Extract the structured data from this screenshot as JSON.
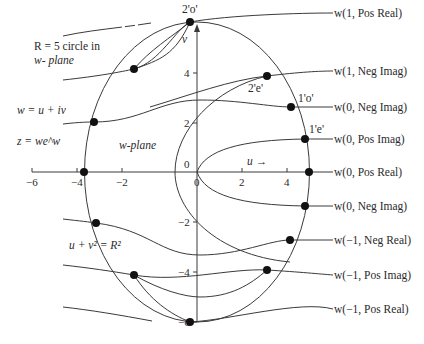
{
  "diagram": {
    "title_note": "R = 5 circle in",
    "title_note_2": "w- plane",
    "eq_w": "w = u + iv",
    "eq_z": "z = we^w",
    "plane_label": "w-plane",
    "u_arrow_label": "u →",
    "v_axis_label": "v",
    "circle_eq": "u + v² = R²",
    "x_ticks": [
      "−6",
      "−4",
      "−2",
      "0",
      "2",
      "4"
    ],
    "y_ticks": [
      "4",
      "2",
      "0",
      "−2",
      "−4",
      "−6"
    ],
    "point_labels": {
      "p2o": "2'o'",
      "p2e": "2'e'",
      "p1o": "1'o'",
      "p1e": "1'e'"
    },
    "branch_labels": [
      "w(1, Pos Real)",
      "w(1, Neg Imag)",
      "w(0, Neg Imag)",
      "w(0, Pos Imag)",
      "w(0, Pos Real)",
      "w(0, Neg Imag)",
      "w(−1, Neg Real)",
      "w(−1, Pos Imag)",
      "w(−1, Pos Real)"
    ],
    "colors": {
      "line": "#3a3a3a",
      "dot": "#111111",
      "text": "#2a2a2a"
    }
  }
}
